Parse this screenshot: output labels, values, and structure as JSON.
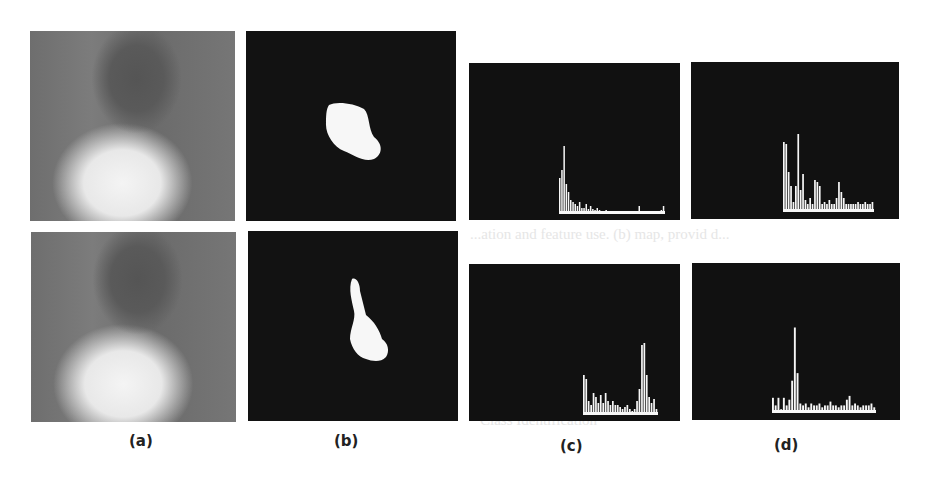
{
  "figure": {
    "captions": {
      "a": "(a)",
      "b": "(b)",
      "c": "(c)",
      "d": "(d)"
    },
    "panels": {
      "a": [
        "Grayscale video frame: person with fist gesture",
        "Grayscale video frame: person with pointing-finger gesture"
      ],
      "b": [
        "Segmented hand mask: fist",
        "Segmented hand mask: pointing finger"
      ],
      "c": [
        "Histogram (fist)",
        "Histogram (pointing finger)"
      ],
      "d": [
        "Histogram (fist)",
        "Histogram (pointing finger)"
      ]
    },
    "colors": {
      "background": "#ffffff",
      "panel_dark": "#111111",
      "foreground": "#f7f7f7"
    }
  },
  "ghost_text": {
    "line1": "...is in the image segmentation, the tracking and segmentation of the hand is highly",
    "line2": "...ation and feature use. (b) map, provid d...",
    "line3": "Class Identification"
  },
  "chart_data": [
    {
      "type": "bar",
      "title": "(c) top",
      "bins": 48,
      "values": [
        0,
        0,
        0,
        0,
        0,
        0,
        0,
        0,
        0,
        0,
        0,
        0,
        0,
        0,
        0,
        0,
        0,
        0,
        0,
        0,
        0,
        0,
        0,
        0,
        0,
        0,
        0,
        0,
        0,
        0,
        0,
        0,
        0,
        0,
        0,
        0,
        0,
        0,
        0,
        0,
        0,
        0,
        0,
        0,
        0,
        0,
        0,
        0
      ],
      "series": [
        {
          "name": "top-left",
          "values": [
            36,
            44,
            68,
            30,
            22,
            14,
            12,
            10,
            8,
            12,
            6,
            6,
            10,
            5,
            8,
            5,
            4,
            6,
            4,
            3,
            3,
            4,
            3,
            3,
            3,
            3,
            3,
            2,
            2,
            3,
            2,
            2,
            3,
            2,
            2,
            2,
            8,
            2,
            2,
            2,
            3,
            2,
            2,
            2,
            3,
            2,
            4,
            8
          ]
        }
      ],
      "xlabel": "",
      "ylabel": "",
      "grid": false
    },
    {
      "type": "bar",
      "title": "(d) top",
      "series": [
        {
          "name": "top-right",
          "values": [
            70,
            68,
            40,
            26,
            10,
            26,
            78,
            22,
            38,
            12,
            8,
            14,
            8,
            32,
            30,
            26,
            8,
            10,
            8,
            12,
            8,
            8,
            14,
            30,
            20,
            14,
            8,
            8,
            8,
            8,
            8,
            10,
            8,
            8,
            10,
            8,
            8,
            10
          ]
        }
      ],
      "xlabel": "",
      "ylabel": "",
      "grid": false
    },
    {
      "type": "bar",
      "title": "(c) bottom",
      "series": [
        {
          "name": "bottom-left",
          "values": [
            40,
            36,
            14,
            10,
            22,
            18,
            12,
            20,
            12,
            22,
            14,
            10,
            14,
            10,
            10,
            8,
            6,
            8,
            10,
            6,
            4,
            6,
            14,
            26,
            70,
            72,
            40,
            18,
            12,
            16,
            6
          ]
        }
      ],
      "xlabel": "",
      "ylabel": "",
      "grid": false
    },
    {
      "type": "bar",
      "title": "(d) bottom",
      "series": [
        {
          "name": "bottom-right",
          "values": [
            16,
            8,
            16,
            4,
            16,
            8,
            14,
            34,
            90,
            42,
            10,
            8,
            10,
            6,
            10,
            8,
            8,
            10,
            6,
            8,
            8,
            12,
            8,
            8,
            6,
            8,
            8,
            14,
            18,
            8,
            10,
            8,
            6,
            8,
            8,
            8,
            10,
            6
          ]
        }
      ],
      "xlabel": "",
      "ylabel": "",
      "grid": false
    }
  ]
}
